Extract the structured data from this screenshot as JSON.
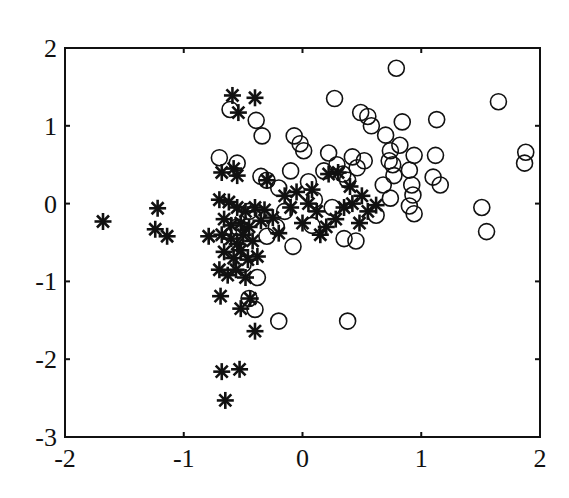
{
  "chart_data": {
    "type": "scatter",
    "title": "",
    "xlabel": "",
    "ylabel": "",
    "xlim": [
      -2,
      2
    ],
    "ylim": [
      -3,
      2
    ],
    "xticks": [
      -2,
      -1,
      0,
      1,
      2
    ],
    "yticks": [
      -3,
      -2,
      -1,
      0,
      1,
      2
    ],
    "xtick_labels": [
      "-2",
      "-1",
      "0",
      "1",
      "2"
    ],
    "ytick_labels": [
      "-3",
      "-2",
      "-1",
      "0",
      "1",
      "2"
    ],
    "grid": false,
    "legend": null,
    "series": [
      {
        "name": "asterisk",
        "marker": "asterisk",
        "color": "#111111",
        "points": [
          [
            -1.68,
            -0.23
          ],
          [
            -1.22,
            -0.06
          ],
          [
            -1.24,
            -0.33
          ],
          [
            -1.14,
            -0.42
          ],
          [
            -0.79,
            -0.42
          ],
          [
            -0.59,
            1.39
          ],
          [
            -0.4,
            1.36
          ],
          [
            -0.54,
            1.17
          ],
          [
            -0.68,
            0.4
          ],
          [
            -0.55,
            0.36
          ],
          [
            -0.58,
            0.45
          ],
          [
            -0.3,
            0.3
          ],
          [
            -0.7,
            0.05
          ],
          [
            -0.62,
            0.02
          ],
          [
            -0.55,
            -0.05
          ],
          [
            -0.48,
            -0.1
          ],
          [
            -0.4,
            -0.05
          ],
          [
            -0.32,
            -0.08
          ],
          [
            -0.66,
            -0.2
          ],
          [
            -0.6,
            -0.28
          ],
          [
            -0.52,
            -0.25
          ],
          [
            -0.45,
            -0.3
          ],
          [
            -0.35,
            -0.22
          ],
          [
            -0.25,
            -0.18
          ],
          [
            -0.68,
            -0.4
          ],
          [
            -0.6,
            -0.45
          ],
          [
            -0.55,
            -0.52
          ],
          [
            -0.5,
            -0.4
          ],
          [
            -0.42,
            -0.48
          ],
          [
            -0.66,
            -0.62
          ],
          [
            -0.58,
            -0.7
          ],
          [
            -0.52,
            -0.6
          ],
          [
            -0.46,
            -0.72
          ],
          [
            -0.38,
            -0.68
          ],
          [
            -0.7,
            -0.85
          ],
          [
            -0.63,
            -0.92
          ],
          [
            -0.56,
            -0.85
          ],
          [
            -0.48,
            -0.95
          ],
          [
            -0.69,
            -1.19
          ],
          [
            -0.52,
            -1.35
          ],
          [
            -0.44,
            -1.22
          ],
          [
            -0.4,
            -1.64
          ],
          [
            -0.68,
            -2.16
          ],
          [
            -0.53,
            -2.13
          ],
          [
            -0.65,
            -2.53
          ],
          [
            -0.15,
            0.1
          ],
          [
            -0.05,
            0.15
          ],
          [
            0.05,
            0.0
          ],
          [
            0.12,
            -0.1
          ],
          [
            -0.1,
            -0.05
          ],
          [
            0.2,
            -0.3
          ],
          [
            0.15,
            -0.4
          ],
          [
            0.28,
            -0.2
          ],
          [
            0.35,
            -0.05
          ],
          [
            0.42,
            0.0
          ],
          [
            0.22,
            0.38
          ],
          [
            0.3,
            0.4
          ],
          [
            0.4,
            0.22
          ],
          [
            0.48,
            -0.25
          ],
          [
            0.55,
            -0.1
          ],
          [
            0.62,
            -0.02
          ],
          [
            0.5,
            0.1
          ],
          [
            0.0,
            -0.25
          ],
          [
            -0.2,
            -0.38
          ],
          [
            0.08,
            0.18
          ]
        ]
      },
      {
        "name": "circle",
        "marker": "circle",
        "color": "#111111",
        "points": [
          [
            -0.61,
            1.21
          ],
          [
            -0.39,
            1.07
          ],
          [
            -0.34,
            0.87
          ],
          [
            -0.7,
            0.59
          ],
          [
            -0.55,
            0.52
          ],
          [
            0.27,
            1.35
          ],
          [
            0.49,
            1.17
          ],
          [
            0.55,
            1.12
          ],
          [
            0.58,
            1.0
          ],
          [
            0.79,
            1.74
          ],
          [
            -0.07,
            0.87
          ],
          [
            -0.02,
            0.77
          ],
          [
            0.01,
            0.68
          ],
          [
            0.22,
            0.65
          ],
          [
            0.29,
            0.5
          ],
          [
            0.46,
            0.46
          ],
          [
            0.68,
            0.24
          ],
          [
            0.74,
            0.68
          ],
          [
            0.73,
            0.55
          ],
          [
            0.77,
            0.36
          ],
          [
            1.13,
            1.08
          ],
          [
            0.84,
            1.05
          ],
          [
            0.7,
            0.88
          ],
          [
            0.82,
            0.75
          ],
          [
            0.94,
            0.62
          ],
          [
            1.12,
            0.62
          ],
          [
            0.9,
            0.43
          ],
          [
            0.76,
            0.5
          ],
          [
            1.1,
            0.34
          ],
          [
            0.92,
            0.24
          ],
          [
            1.16,
            0.24
          ],
          [
            0.93,
            0.11
          ],
          [
            0.74,
            0.07
          ],
          [
            0.9,
            -0.03
          ],
          [
            0.94,
            -0.13
          ],
          [
            1.65,
            1.31
          ],
          [
            1.88,
            0.66
          ],
          [
            1.87,
            0.52
          ],
          [
            1.51,
            -0.05
          ],
          [
            1.55,
            -0.36
          ],
          [
            -0.4,
            -1.36
          ],
          [
            -0.2,
            -1.51
          ],
          [
            0.38,
            -1.51
          ],
          [
            -0.35,
            0.35
          ],
          [
            -0.3,
            0.3
          ],
          [
            -0.2,
            0.2
          ],
          [
            -0.1,
            0.42
          ],
          [
            0.05,
            0.28
          ],
          [
            0.18,
            0.42
          ],
          [
            0.34,
            0.38
          ],
          [
            0.38,
            0.3
          ],
          [
            0.42,
            0.6
          ],
          [
            0.52,
            0.55
          ],
          [
            -0.45,
            -0.1
          ],
          [
            -0.3,
            -0.42
          ],
          [
            -0.22,
            -0.3
          ],
          [
            -0.08,
            -0.55
          ],
          [
            -0.15,
            -0.1
          ],
          [
            0.08,
            -0.28
          ],
          [
            0.25,
            -0.05
          ],
          [
            0.35,
            -0.45
          ],
          [
            0.45,
            -0.48
          ],
          [
            0.62,
            -0.15
          ],
          [
            -0.55,
            -0.3
          ],
          [
            -0.5,
            -0.78
          ],
          [
            -0.38,
            -0.95
          ],
          [
            -0.45,
            -1.22
          ],
          [
            0.1,
            0.05
          ]
        ]
      }
    ]
  }
}
